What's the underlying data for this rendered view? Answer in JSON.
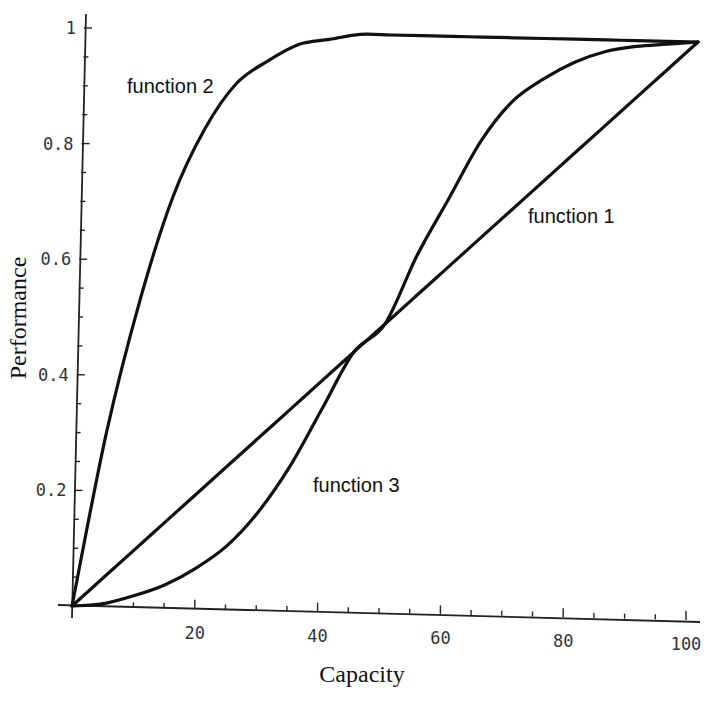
{
  "chart_data": {
    "type": "line",
    "title": "",
    "xlabel": "Capacity",
    "ylabel": "Performance",
    "xlim": [
      0,
      100
    ],
    "ylim": [
      0,
      1
    ],
    "grid": false,
    "legend": "none (curves labeled inline)",
    "x_ticks": [
      "20",
      "40",
      "60",
      "80",
      "100"
    ],
    "y_ticks": [
      "0.2",
      "0.4",
      "0.6",
      "0.8",
      "1"
    ],
    "x": [
      0,
      5,
      10,
      15,
      20,
      25,
      30,
      35,
      40,
      45,
      50,
      55,
      60,
      65,
      70,
      75,
      80,
      85,
      90,
      95,
      100
    ],
    "series": [
      {
        "name": "function 1",
        "values": [
          0.0,
          0.05,
          0.1,
          0.15,
          0.2,
          0.25,
          0.3,
          0.35,
          0.4,
          0.45,
          0.5,
          0.55,
          0.6,
          0.65,
          0.7,
          0.75,
          0.8,
          0.85,
          0.9,
          0.95,
          1.0
        ]
      },
      {
        "name": "function 2",
        "values": [
          0.0,
          0.3,
          0.53,
          0.71,
          0.83,
          0.91,
          0.95,
          0.98,
          0.99,
          1.0,
          1.0,
          1.0,
          1.0,
          1.0,
          1.0,
          1.0,
          1.0,
          1.0,
          1.0,
          1.0,
          1.0
        ]
      },
      {
        "name": "function 3",
        "values": [
          0.0,
          0.005,
          0.02,
          0.04,
          0.07,
          0.11,
          0.17,
          0.25,
          0.35,
          0.45,
          0.5,
          0.62,
          0.72,
          0.82,
          0.89,
          0.93,
          0.96,
          0.98,
          0.99,
          0.995,
          1.0
        ]
      }
    ],
    "annotations": [
      {
        "text": "function 1",
        "x": 78,
        "y": 0.68
      },
      {
        "text": "function 2",
        "x": 18,
        "y": 0.9
      },
      {
        "text": "function 3",
        "x": 48,
        "y": 0.2
      }
    ]
  }
}
